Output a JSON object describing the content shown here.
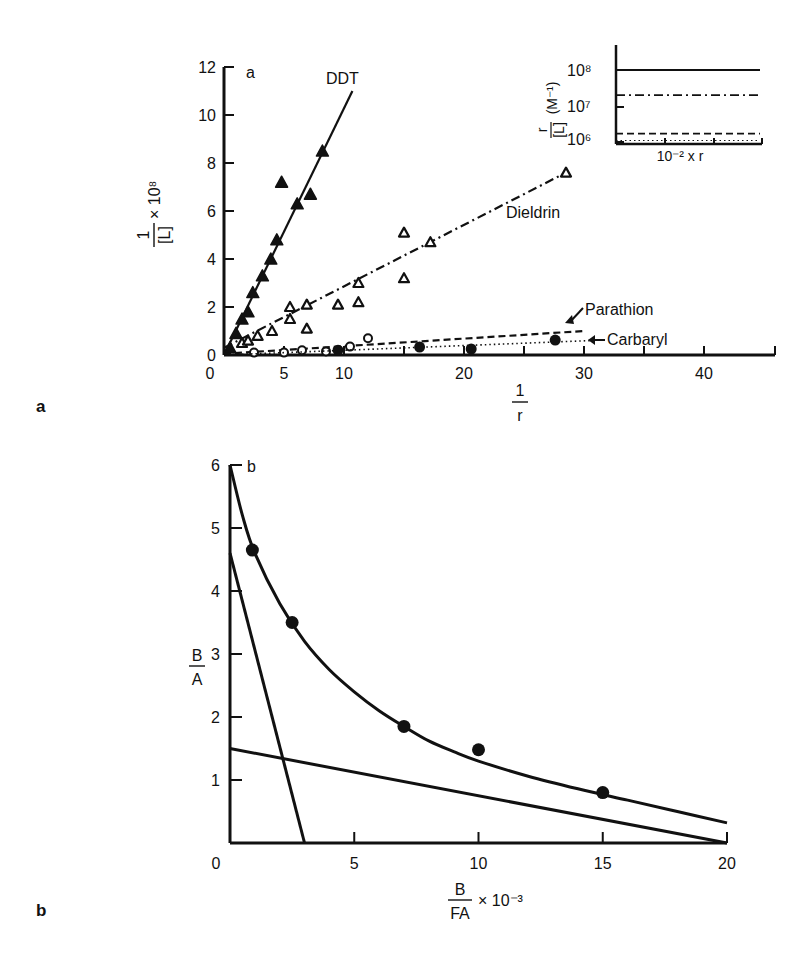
{
  "chart_data": [
    {
      "panel": "a",
      "type": "scatter",
      "panel_label": "a",
      "inner_label": "a",
      "title": "",
      "xlabel_num": "1",
      "xlabel_den": "r",
      "ylabel_num": "1",
      "ylabel_den": "[L]",
      "ylabel_suffix": "× 10⁸",
      "xlim": [
        0,
        45
      ],
      "ylim": [
        0,
        12
      ],
      "xticks": [
        0,
        10,
        20,
        30,
        40
      ],
      "xticks_minor": [
        5,
        15,
        25,
        35
      ],
      "yticks": [
        0,
        2,
        4,
        6,
        8,
        10,
        12
      ],
      "grid": false,
      "series": [
        {
          "name": "DDT",
          "marker": "filled-triangle",
          "line": "solid",
          "fit_line": [
            [
              0,
              0
            ],
            [
              10.7,
              11.0
            ]
          ],
          "points": [
            [
              0.5,
              0.3
            ],
            [
              1.0,
              0.9
            ],
            [
              1.5,
              1.5
            ],
            [
              2.0,
              1.8
            ],
            [
              2.4,
              2.6
            ],
            [
              3.2,
              3.3
            ],
            [
              3.9,
              4.0
            ],
            [
              4.4,
              4.8
            ],
            [
              4.8,
              7.2
            ],
            [
              6.1,
              6.3
            ],
            [
              7.2,
              6.7
            ],
            [
              8.2,
              8.5
            ]
          ]
        },
        {
          "name": "Dieldrin",
          "marker": "open-triangle",
          "line": "dash-dot",
          "fit_line": [
            [
              0,
              0.3
            ],
            [
              28.5,
              7.6
            ]
          ],
          "points": [
            [
              1.5,
              0.5
            ],
            [
              2.0,
              0.6
            ],
            [
              2.8,
              0.8
            ],
            [
              4.0,
              1.0
            ],
            [
              5.5,
              1.5
            ],
            [
              5.5,
              2.0
            ],
            [
              6.9,
              1.1
            ],
            [
              6.9,
              2.1
            ],
            [
              9.5,
              2.1
            ],
            [
              11.2,
              2.2
            ],
            [
              11.2,
              3.0
            ],
            [
              15.0,
              3.2
            ],
            [
              15.0,
              5.1
            ],
            [
              17.2,
              4.7
            ],
            [
              28.5,
              7.6
            ]
          ]
        },
        {
          "name": "Parathion",
          "marker": "open-circle",
          "line": "dashed",
          "fit_line": [
            [
              0,
              0.05
            ],
            [
              30,
              1.0
            ]
          ],
          "points": [
            [
              2.5,
              0.1
            ],
            [
              5.0,
              0.1
            ],
            [
              6.5,
              0.2
            ],
            [
              8.5,
              0.15
            ],
            [
              10.5,
              0.35
            ],
            [
              12.0,
              0.7
            ]
          ]
        },
        {
          "name": "Carbaryl",
          "marker": "filled-circle",
          "line": "dotted",
          "fit_line": [
            [
              0,
              0.0
            ],
            [
              30.5,
              0.6
            ]
          ],
          "points": [
            [
              9.5,
              0.2
            ],
            [
              16.3,
              0.33
            ],
            [
              20.6,
              0.25
            ],
            [
              27.6,
              0.62
            ]
          ]
        }
      ],
      "inset": {
        "ylabel_num": "r",
        "ylabel_den": "[L]",
        "ylabel_unit": "(M⁻¹)",
        "xlabel": "10⁻² x r",
        "yticks": [
          "10⁸",
          "10⁷",
          "10⁶"
        ],
        "ytick_values": [
          100000000,
          10000000,
          1000000
        ],
        "lines": [
          {
            "series": "DDT",
            "style": "solid",
            "value": 100000000
          },
          {
            "series": "Dieldrin",
            "style": "dash-dot",
            "value": 20000000
          },
          {
            "series": "Parathion",
            "style": "dashed",
            "value": 1700000
          },
          {
            "series": "Carbaryl",
            "style": "dotted",
            "value": 1100000
          }
        ]
      },
      "annotations": [
        "DDT",
        "Dieldrin",
        "Parathion",
        "Carbaryl"
      ]
    },
    {
      "panel": "b",
      "type": "line",
      "panel_label": "b",
      "inner_label": "b",
      "title": "",
      "xlabel_num": "B",
      "xlabel_den": "FA",
      "xlabel_suffix": "× 10⁻³",
      "ylabel_num": "B",
      "ylabel_den": "A",
      "xlim": [
        0,
        20
      ],
      "ylim": [
        0,
        6
      ],
      "xticks": [
        0,
        5,
        10,
        15,
        20
      ],
      "yticks": [
        1,
        2,
        3,
        4,
        5,
        6
      ],
      "grid": false,
      "series": [
        {
          "name": "data-curve",
          "marker": "filled-circle",
          "line": "solid-curve",
          "points": [
            [
              0.9,
              4.65
            ],
            [
              2.5,
              3.5
            ],
            [
              7.0,
              1.85
            ],
            [
              10.0,
              1.48
            ],
            [
              15.0,
              0.8
            ]
          ],
          "curve": [
            [
              0,
              6.0
            ],
            [
              0.5,
              5.2
            ],
            [
              1.0,
              4.6
            ],
            [
              2.0,
              3.8
            ],
            [
              3.0,
              3.2
            ],
            [
              4.0,
              2.75
            ],
            [
              5.0,
              2.4
            ],
            [
              6.0,
              2.1
            ],
            [
              7.0,
              1.85
            ],
            [
              8.0,
              1.62
            ],
            [
              9.0,
              1.45
            ],
            [
              10.0,
              1.3
            ],
            [
              12.0,
              1.06
            ],
            [
              14.0,
              0.86
            ],
            [
              16.0,
              0.68
            ],
            [
              18.0,
              0.5
            ],
            [
              20.0,
              0.32
            ]
          ]
        },
        {
          "name": "high-affinity-component",
          "marker": "none",
          "line": "solid",
          "line_points": [
            [
              0,
              4.6
            ],
            [
              3.0,
              0
            ]
          ]
        },
        {
          "name": "low-affinity-component",
          "marker": "none",
          "line": "solid",
          "line_points": [
            [
              0,
              1.5
            ],
            [
              20,
              0
            ]
          ]
        }
      ]
    }
  ]
}
